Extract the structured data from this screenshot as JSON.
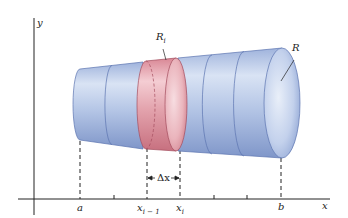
{
  "figure": {
    "type": "solid-of-revolution-slice",
    "labels": {
      "y_axis": "y",
      "x_axis": "x",
      "region_slice": "R",
      "region_slice_sub": "i",
      "region": "R",
      "a": "a",
      "x_prev": "x",
      "x_prev_sub": "i − 1",
      "x_cur": "x",
      "x_cur_sub": "i",
      "b": "b",
      "delta_x": "Δx"
    },
    "colors": {
      "solid_blue": "#a9bde0",
      "solid_blue_dark": "#6f86c0",
      "slice_red": "#e3a0aa",
      "slice_red_dark": "#b85a6a",
      "axis": "#222222"
    }
  }
}
